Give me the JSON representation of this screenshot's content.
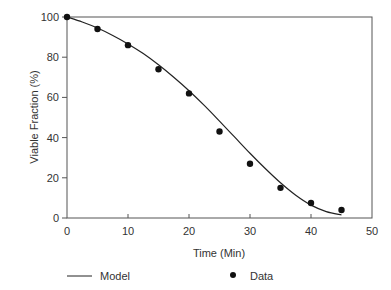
{
  "chart_data": {
    "type": "scatter",
    "title": "",
    "xlabel": "Time (Min)",
    "ylabel": "Viable Fraction (%)",
    "xlim": [
      0,
      50
    ],
    "ylim": [
      0,
      100
    ],
    "xticks": [
      0,
      10,
      20,
      30,
      40,
      50
    ],
    "yticks": [
      0,
      20,
      40,
      60,
      80,
      100
    ],
    "grid": false,
    "legend_position": "bottom",
    "series": [
      {
        "name": "Model",
        "type": "line",
        "x": [
          0,
          2.5,
          5,
          7.5,
          10,
          12.5,
          15,
          17.5,
          20,
          22.5,
          25,
          27.5,
          30,
          32.5,
          35,
          37.5,
          40,
          42.5,
          45
        ],
        "values": [
          100,
          97.5,
          94.5,
          90.8,
          86.6,
          81.8,
          76.2,
          70,
          63.3,
          56,
          48.2,
          40.2,
          32.2,
          24.6,
          17.5,
          11.3,
          6.4,
          3.2,
          1.5
        ]
      },
      {
        "name": "Data",
        "type": "scatter",
        "x": [
          0,
          5,
          10,
          15,
          20,
          25,
          30,
          35,
          40,
          45
        ],
        "values": [
          100,
          94,
          86,
          74,
          62,
          43,
          27,
          15,
          7.5,
          4
        ]
      }
    ]
  },
  "colors": {
    "axis": "#555555",
    "line": "#222222",
    "marker": "#111111"
  }
}
